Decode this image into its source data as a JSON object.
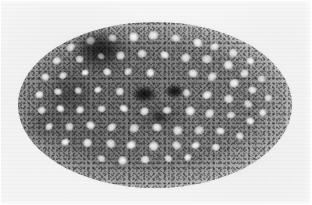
{
  "image": {
    "kind": "electron-micrograph",
    "modality": "transmission electron microscopy (TEM)",
    "color_mode": "grayscale",
    "width_px": 312,
    "height_px": 205,
    "description": "Grayscale transmission electron micrograph of an elliptical cell profile in cross-section, densely packed with pale round vesicles set in a dark granular matrix, on a near-white film background.",
    "no_visible_text": true,
    "no_scale_bar": true,
    "no_labels": true
  },
  "colors": {
    "background": "#f3f3f3",
    "plate_light": "#f6f6f6",
    "plate_mid": "#f1f1f1",
    "cell_matrix_dark": "#5a5a5a",
    "cell_matrix_mid": "#8d8d8d",
    "cell_matrix_light": "#b4b4b4",
    "vesicle_lumen": "#f7f7f7",
    "vesicle_rim": "#9a9a9a",
    "electron_dense": "#2a2a2a",
    "rim_halo": "#9b9b9b"
  },
  "specimen": {
    "outline": {
      "shape": "ellipse",
      "center_x": 155,
      "center_y": 105,
      "radius_x": 137,
      "radius_y": 83,
      "rotation_deg": -3,
      "edge": "diffuse, granular, no sharp membrane visible"
    },
    "regions": [
      {
        "name": "dense-patch-upper-left",
        "cx": 100,
        "cy": 50,
        "rx": 26,
        "ry": 19,
        "density": "high"
      },
      {
        "name": "dense-patch-center",
        "cx": 145,
        "cy": 95,
        "rx": 14,
        "ry": 10,
        "density": "very-high"
      },
      {
        "name": "dense-patch-center-right",
        "cx": 175,
        "cy": 92,
        "rx": 11,
        "ry": 8,
        "density": "very-high"
      },
      {
        "name": "dense-patch-lower-center",
        "cx": 160,
        "cy": 118,
        "rx": 9,
        "ry": 6,
        "density": "high"
      },
      {
        "name": "granular-left-lobe",
        "cx": 72,
        "cy": 100,
        "rx": 36,
        "ry": 42,
        "density": "medium-high"
      },
      {
        "name": "vesicle-rich-right-lobe",
        "cx": 225,
        "cy": 100,
        "rx": 55,
        "ry": 55,
        "density": "low"
      }
    ],
    "vesicles": {
      "count": 68,
      "mean_diameter_px": 13,
      "min_diameter_px": 8,
      "max_diameter_px": 19,
      "appearance": "pale, round to ovoid, electron-lucent lumen with faint darker limiting rim",
      "positions": [
        [
          72,
          48,
          13
        ],
        [
          92,
          42,
          12
        ],
        [
          113,
          40,
          12
        ],
        [
          133,
          38,
          13
        ],
        [
          155,
          37,
          14
        ],
        [
          176,
          40,
          13
        ],
        [
          197,
          44,
          13
        ],
        [
          216,
          48,
          12
        ],
        [
          234,
          54,
          12
        ],
        [
          250,
          62,
          11
        ],
        [
          58,
          62,
          12
        ],
        [
          80,
          60,
          11
        ],
        [
          101,
          58,
          10
        ],
        [
          122,
          56,
          12
        ],
        [
          143,
          55,
          12
        ],
        [
          165,
          57,
          12
        ],
        [
          187,
          58,
          13
        ],
        [
          208,
          61,
          14
        ],
        [
          228,
          66,
          13
        ],
        [
          246,
          74,
          12
        ],
        [
          262,
          80,
          11
        ],
        [
          45,
          78,
          11
        ],
        [
          64,
          76,
          11
        ],
        [
          86,
          74,
          10
        ],
        [
          107,
          73,
          11
        ],
        [
          129,
          72,
          11
        ],
        [
          151,
          73,
          11
        ],
        [
          193,
          75,
          13
        ],
        [
          214,
          78,
          14
        ],
        [
          235,
          84,
          13
        ],
        [
          253,
          92,
          12
        ],
        [
          268,
          99,
          10
        ],
        [
          40,
          95,
          11
        ],
        [
          58,
          93,
          11
        ],
        [
          78,
          92,
          10
        ],
        [
          99,
          91,
          10
        ],
        [
          120,
          92,
          11
        ],
        [
          186,
          94,
          11
        ],
        [
          208,
          96,
          13
        ],
        [
          229,
          100,
          13
        ],
        [
          248,
          106,
          12
        ],
        [
          264,
          113,
          10
        ],
        [
          42,
          111,
          11
        ],
        [
          60,
          110,
          11
        ],
        [
          81,
          110,
          11
        ],
        [
          102,
          110,
          11
        ],
        [
          124,
          111,
          12
        ],
        [
          146,
          112,
          12
        ],
        [
          168,
          112,
          12
        ],
        [
          190,
          112,
          13
        ],
        [
          211,
          114,
          13
        ],
        [
          232,
          117,
          12
        ],
        [
          250,
          122,
          11
        ],
        [
          50,
          127,
          11
        ],
        [
          70,
          127,
          11
        ],
        [
          91,
          127,
          12
        ],
        [
          113,
          128,
          13
        ],
        [
          135,
          129,
          13
        ],
        [
          157,
          129,
          13
        ],
        [
          179,
          130,
          13
        ],
        [
          200,
          131,
          13
        ],
        [
          221,
          133,
          12
        ],
        [
          239,
          137,
          11
        ],
        [
          66,
          143,
          11
        ],
        [
          88,
          144,
          12
        ],
        [
          110,
          145,
          13
        ],
        [
          132,
          146,
          13
        ],
        [
          154,
          147,
          13
        ],
        [
          176,
          147,
          13
        ],
        [
          197,
          147,
          12
        ],
        [
          216,
          148,
          11
        ],
        [
          101,
          160,
          11
        ],
        [
          124,
          161,
          12
        ],
        [
          146,
          161,
          12
        ],
        [
          168,
          160,
          11
        ],
        [
          189,
          158,
          10
        ]
      ]
    }
  },
  "annotations": {
    "scale_bar": null,
    "labels": [],
    "arrows": [],
    "caption": ""
  }
}
